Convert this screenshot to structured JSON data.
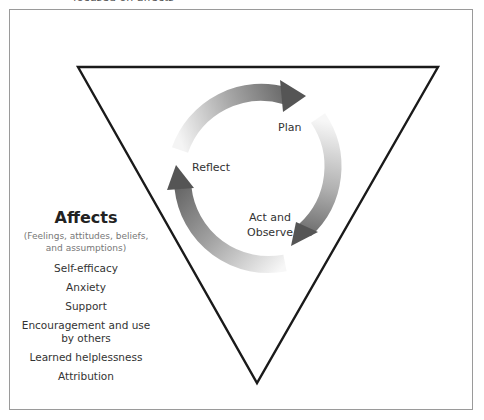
{
  "caption_cut": "focused on affects",
  "cycle": {
    "steps": [
      {
        "label": "Plan"
      },
      {
        "label": "Act and\nObserve",
        "line1": "Act and",
        "line2": "Observe"
      },
      {
        "label": "Reflect"
      }
    ]
  },
  "affects": {
    "title": "Affects",
    "subtitle_line1": "(Feelings, attitudes, beliefs,",
    "subtitle_line2": "and assumptions)",
    "items": [
      "Self-efficacy",
      "Anxiety",
      "Support",
      "Encouragement and use by others",
      "Learned helplessness",
      "Attribution"
    ],
    "items_display": {
      "enc_line1": "Encouragement and use",
      "enc_line2": "by others"
    }
  },
  "colors": {
    "triangle_stroke": "#1a1a1a",
    "frame_border": "#9a9a9a",
    "arrow_dark": "#5a5a5a",
    "arrow_light": "#f2f2f2"
  }
}
